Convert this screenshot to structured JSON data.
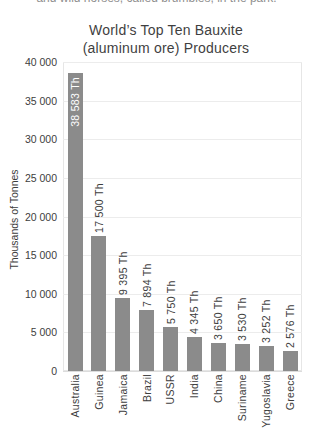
{
  "page": {
    "top_clipped_text": "and wild horses, called brumbies, in the park."
  },
  "chart_data": {
    "type": "bar",
    "title": "World’s Top Ten Bauxite\n(aluminum ore) Producers",
    "ylabel": "Thousands of Tonnes",
    "categories": [
      "Australia",
      "Guinea",
      "Jamaica",
      "Brazil",
      "USSR",
      "India",
      "China",
      "Suriname",
      "Yugoslavia",
      "Greece"
    ],
    "values": [
      38583,
      17500,
      9395,
      7894,
      5750,
      4345,
      3650,
      3530,
      3252,
      2576
    ],
    "bar_labels": [
      "38 583 Th",
      "17 500 Th",
      "9 395 Th",
      "7 894 Th",
      "5 750 Th",
      "4 345 Th",
      "3 650 Th",
      "3 530 Th",
      "3 252 Th",
      "2 576 Th"
    ],
    "unit_suffix": "Th",
    "ylim": [
      0,
      40000
    ],
    "ytick_values": [
      0,
      5000,
      10000,
      15000,
      20000,
      25000,
      30000,
      35000,
      40000
    ],
    "ytick_labels": [
      "0",
      "5 000",
      "10 000",
      "15 000",
      "20 000",
      "25 000",
      "30 000",
      "35 000",
      "40 000"
    ],
    "grid": true,
    "legend_position": "none",
    "bar_color": "#8b8b8b",
    "label_color": "#3d3d3d",
    "inside_label_color": "#ffffff",
    "gridline_color": "#ececec"
  }
}
